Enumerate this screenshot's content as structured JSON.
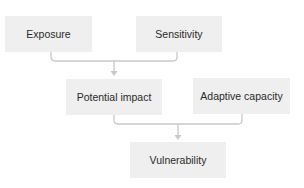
{
  "diagram": {
    "type": "flowchart",
    "colors": {
      "node_fill": "#efefef",
      "node_text": "#2a2a2a",
      "connector": "#c8c8c8",
      "background": "#ffffff"
    },
    "nodes": [
      {
        "id": "exposure",
        "label": "Exposure"
      },
      {
        "id": "sensitivity",
        "label": "Sensitivity"
      },
      {
        "id": "potential_impact",
        "label": "Potential impact"
      },
      {
        "id": "adaptive_capacity",
        "label": "Adaptive capacity"
      },
      {
        "id": "vulnerability",
        "label": "Vulnerability"
      }
    ],
    "edges": [
      {
        "from": [
          "exposure",
          "sensitivity"
        ],
        "to": "potential_impact"
      },
      {
        "from": [
          "potential_impact",
          "adaptive_capacity"
        ],
        "to": "vulnerability"
      }
    ]
  }
}
